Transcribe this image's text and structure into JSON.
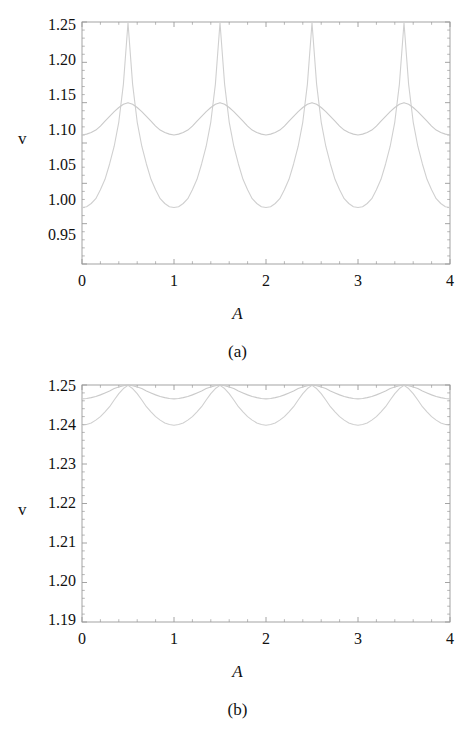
{
  "figure": {
    "background_color": "#ffffff",
    "text_color": "#111111",
    "frame_color": "#9a9a9a",
    "curve_color_primary": "#d2d2d2",
    "curve_color_secondary": "#c9c9c9"
  },
  "panels": [
    {
      "id": "a",
      "caption": "(a)",
      "xlabel": "A",
      "ylabel": "v",
      "x_ticks": [
        "0",
        "1",
        "2",
        "3",
        "4"
      ],
      "y_ticks": [
        "0.95",
        "1.00",
        "1.05",
        "1.10",
        "1.15",
        "1.20",
        "1.25"
      ]
    },
    {
      "id": "b",
      "caption": "(b)",
      "xlabel": "A",
      "ylabel": "v",
      "x_ticks": [
        "0",
        "1",
        "2",
        "3",
        "4"
      ],
      "y_ticks": [
        "1.19",
        "1.20",
        "1.21",
        "1.22",
        "1.23",
        "1.24",
        "1.25"
      ]
    }
  ],
  "chart_data": [
    {
      "type": "line",
      "panel": "a",
      "title": "(a)",
      "xlabel": "A",
      "ylabel": "v",
      "xlim": [
        0,
        4
      ],
      "ylim": [
        0.95,
        1.25
      ],
      "xticks": [
        0,
        1,
        2,
        3,
        4
      ],
      "yticks": [
        0.95,
        1.0,
        1.05,
        1.1,
        1.15,
        1.2,
        1.25
      ],
      "grid": false,
      "legend": "none",
      "frame": "box-with-inner-ticks",
      "series": [
        {
          "name": "large-amplitude oscillation",
          "color": "#d0d0d0",
          "description": "period 1 in A, minima 1.020 at A=0,1,2,3,4; maxima 1.249 at A=0.5,1.5,2.5,3.5",
          "x": [
            0.0,
            0.05,
            0.1,
            0.15,
            0.2,
            0.25,
            0.3,
            0.35,
            0.4,
            0.45,
            0.5,
            0.55,
            0.6,
            0.65,
            0.7,
            0.75,
            0.8,
            0.85,
            0.9,
            0.95,
            1.0,
            1.05,
            1.1,
            1.15,
            1.2,
            1.25,
            1.3,
            1.35,
            1.4,
            1.45,
            1.5,
            1.55,
            1.6,
            1.65,
            1.7,
            1.75,
            1.8,
            1.85,
            1.9,
            1.95,
            2.0,
            2.05,
            2.1,
            2.15,
            2.2,
            2.25,
            2.3,
            2.35,
            2.4,
            2.45,
            2.5,
            2.55,
            2.6,
            2.65,
            2.7,
            2.75,
            2.8,
            2.85,
            2.9,
            2.95,
            3.0,
            3.05,
            3.1,
            3.15,
            3.2,
            3.25,
            3.3,
            3.35,
            3.4,
            3.45,
            3.5,
            3.55,
            3.6,
            3.65,
            3.7,
            3.75,
            3.8,
            3.85,
            3.9,
            3.95,
            4.0
          ],
          "y": [
            1.02,
            1.021,
            1.025,
            1.031,
            1.042,
            1.055,
            1.074,
            1.096,
            1.126,
            1.173,
            1.249,
            1.173,
            1.126,
            1.096,
            1.074,
            1.055,
            1.042,
            1.031,
            1.025,
            1.021,
            1.02,
            1.021,
            1.025,
            1.031,
            1.042,
            1.055,
            1.074,
            1.096,
            1.126,
            1.173,
            1.249,
            1.173,
            1.126,
            1.096,
            1.074,
            1.055,
            1.042,
            1.031,
            1.025,
            1.021,
            1.02,
            1.021,
            1.025,
            1.031,
            1.042,
            1.055,
            1.074,
            1.096,
            1.126,
            1.173,
            1.249,
            1.173,
            1.126,
            1.096,
            1.074,
            1.055,
            1.042,
            1.031,
            1.025,
            1.021,
            1.02,
            1.021,
            1.025,
            1.031,
            1.042,
            1.055,
            1.074,
            1.096,
            1.126,
            1.173,
            1.249,
            1.173,
            1.126,
            1.096,
            1.074,
            1.055,
            1.042,
            1.031,
            1.025,
            1.021,
            1.02
          ]
        },
        {
          "name": "small-amplitude oscillation",
          "color": "#cacaca",
          "description": "period 1 in A, minima 1.110 at A=0,1,2,3,4; maxima 1.150 at A=0.5,1.5,2.5,3.5",
          "x": [
            0.0,
            0.05,
            0.1,
            0.15,
            0.2,
            0.25,
            0.3,
            0.35,
            0.4,
            0.45,
            0.5,
            0.55,
            0.6,
            0.65,
            0.7,
            0.75,
            0.8,
            0.85,
            0.9,
            0.95,
            1.0,
            1.05,
            1.1,
            1.15,
            1.2,
            1.25,
            1.3,
            1.35,
            1.4,
            1.45,
            1.5,
            1.55,
            1.6,
            1.65,
            1.7,
            1.75,
            1.8,
            1.85,
            1.9,
            1.95,
            2.0,
            2.05,
            2.1,
            2.15,
            2.2,
            2.25,
            2.3,
            2.35,
            2.4,
            2.45,
            2.5,
            2.55,
            2.6,
            2.65,
            2.7,
            2.75,
            2.8,
            2.85,
            2.9,
            2.95,
            3.0,
            3.05,
            3.1,
            3.15,
            3.2,
            3.25,
            3.3,
            3.35,
            3.4,
            3.45,
            3.5,
            3.55,
            3.6,
            3.65,
            3.7,
            3.75,
            3.8,
            3.85,
            3.9,
            3.95,
            4.0
          ],
          "y": [
            1.11,
            1.111,
            1.113,
            1.116,
            1.121,
            1.127,
            1.133,
            1.139,
            1.144,
            1.148,
            1.15,
            1.148,
            1.144,
            1.139,
            1.133,
            1.127,
            1.121,
            1.116,
            1.113,
            1.111,
            1.11,
            1.111,
            1.113,
            1.116,
            1.121,
            1.127,
            1.133,
            1.139,
            1.144,
            1.148,
            1.15,
            1.148,
            1.144,
            1.139,
            1.133,
            1.127,
            1.121,
            1.116,
            1.113,
            1.111,
            1.11,
            1.111,
            1.113,
            1.116,
            1.121,
            1.127,
            1.133,
            1.139,
            1.144,
            1.148,
            1.15,
            1.148,
            1.144,
            1.139,
            1.133,
            1.127,
            1.121,
            1.116,
            1.113,
            1.111,
            1.11,
            1.111,
            1.113,
            1.116,
            1.121,
            1.127,
            1.133,
            1.139,
            1.144,
            1.148,
            1.15,
            1.148,
            1.144,
            1.139,
            1.133,
            1.127,
            1.121,
            1.116,
            1.113,
            1.111,
            1.11
          ]
        }
      ]
    },
    {
      "type": "line",
      "panel": "b",
      "title": "(b)",
      "xlabel": "A",
      "ylabel": "v",
      "xlim": [
        0,
        4
      ],
      "ylim": [
        1.19,
        1.25
      ],
      "xticks": [
        0,
        1,
        2,
        3,
        4
      ],
      "yticks": [
        1.19,
        1.2,
        1.21,
        1.22,
        1.23,
        1.24,
        1.25
      ],
      "grid": false,
      "legend": "none",
      "frame": "box-with-inner-ticks",
      "series": [
        {
          "name": "larger-amplitude oscillation",
          "color": "#d0d0d0",
          "description": "period 1 in A, minima 1.2398 at A=0,1,2,3,4; maxima 1.2499 at A=0.5,1.5,2.5,3.5",
          "x": [
            0.0,
            0.05,
            0.1,
            0.15,
            0.2,
            0.25,
            0.3,
            0.35,
            0.4,
            0.45,
            0.5,
            0.55,
            0.6,
            0.65,
            0.7,
            0.75,
            0.8,
            0.85,
            0.9,
            0.95,
            1.0,
            1.05,
            1.1,
            1.15,
            1.2,
            1.25,
            1.3,
            1.35,
            1.4,
            1.45,
            1.5,
            1.55,
            1.6,
            1.65,
            1.7,
            1.75,
            1.8,
            1.85,
            1.9,
            1.95,
            2.0,
            2.05,
            2.1,
            2.15,
            2.2,
            2.25,
            2.3,
            2.35,
            2.4,
            2.45,
            2.5,
            2.55,
            2.6,
            2.65,
            2.7,
            2.75,
            2.8,
            2.85,
            2.9,
            2.95,
            3.0,
            3.05,
            3.1,
            3.15,
            3.2,
            3.25,
            3.3,
            3.35,
            3.4,
            3.45,
            3.5,
            3.55,
            3.6,
            3.65,
            3.7,
            3.75,
            3.8,
            3.85,
            3.9,
            3.95,
            4.0
          ],
          "y": [
            1.2398,
            1.24,
            1.2404,
            1.2411,
            1.242,
            1.2432,
            1.2445,
            1.2462,
            1.2478,
            1.2491,
            1.2499,
            1.2491,
            1.2478,
            1.2462,
            1.2445,
            1.2432,
            1.242,
            1.2411,
            1.2404,
            1.24,
            1.2398,
            1.24,
            1.2404,
            1.2411,
            1.242,
            1.2432,
            1.2445,
            1.2462,
            1.2478,
            1.2491,
            1.2499,
            1.2491,
            1.2478,
            1.2462,
            1.2445,
            1.2432,
            1.242,
            1.2411,
            1.2404,
            1.24,
            1.2398,
            1.24,
            1.2404,
            1.2411,
            1.242,
            1.2432,
            1.2445,
            1.2462,
            1.2478,
            1.2491,
            1.2499,
            1.2491,
            1.2478,
            1.2462,
            1.2445,
            1.2432,
            1.242,
            1.2411,
            1.2404,
            1.24,
            1.2398,
            1.24,
            1.2404,
            1.2411,
            1.242,
            1.2432,
            1.2445,
            1.2462,
            1.2478,
            1.2491,
            1.2499,
            1.2491,
            1.2478,
            1.2462,
            1.2445,
            1.2432,
            1.242,
            1.2411,
            1.2404,
            1.24,
            1.2398
          ]
        },
        {
          "name": "smaller-amplitude oscillation",
          "color": "#cacaca",
          "description": "period 1 in A, minima 1.2465 at A=0,1,2,3,4; maxima 1.2500 at A=0.5,1.5,2.5,3.5",
          "x": [
            0.0,
            0.05,
            0.1,
            0.15,
            0.2,
            0.25,
            0.3,
            0.35,
            0.4,
            0.45,
            0.5,
            0.55,
            0.6,
            0.65,
            0.7,
            0.75,
            0.8,
            0.85,
            0.9,
            0.95,
            1.0,
            1.05,
            1.1,
            1.15,
            1.2,
            1.25,
            1.3,
            1.35,
            1.4,
            1.45,
            1.5,
            1.55,
            1.6,
            1.65,
            1.7,
            1.75,
            1.8,
            1.85,
            1.9,
            1.95,
            2.0,
            2.05,
            2.1,
            2.15,
            2.2,
            2.25,
            2.3,
            2.35,
            2.4,
            2.45,
            2.5,
            2.55,
            2.6,
            2.65,
            2.7,
            2.75,
            2.8,
            2.85,
            2.9,
            2.95,
            3.0,
            3.05,
            3.1,
            3.15,
            3.2,
            3.25,
            3.3,
            3.35,
            3.4,
            3.45,
            3.5,
            3.55,
            3.6,
            3.65,
            3.7,
            3.75,
            3.8,
            3.85,
            3.9,
            3.95,
            4.0
          ],
          "y": [
            1.2465,
            1.2466,
            1.2468,
            1.2471,
            1.2475,
            1.248,
            1.2485,
            1.2491,
            1.2495,
            1.2498,
            1.25,
            1.2498,
            1.2495,
            1.2491,
            1.2485,
            1.248,
            1.2475,
            1.2471,
            1.2468,
            1.2466,
            1.2465,
            1.2466,
            1.2468,
            1.2471,
            1.2475,
            1.248,
            1.2485,
            1.2491,
            1.2495,
            1.2498,
            1.25,
            1.2498,
            1.2495,
            1.2491,
            1.2485,
            1.248,
            1.2475,
            1.2471,
            1.2468,
            1.2466,
            1.2465,
            1.2466,
            1.2468,
            1.2471,
            1.2475,
            1.248,
            1.2485,
            1.2491,
            1.2495,
            1.2498,
            1.25,
            1.2498,
            1.2495,
            1.2491,
            1.2485,
            1.248,
            1.2475,
            1.2471,
            1.2468,
            1.2466,
            1.2465,
            1.2466,
            1.2468,
            1.2471,
            1.2475,
            1.248,
            1.2485,
            1.2491,
            1.2495,
            1.2498,
            1.25,
            1.2498,
            1.2495,
            1.2491,
            1.2485,
            1.248,
            1.2475,
            1.2471,
            1.2468,
            1.2466,
            1.2465
          ]
        }
      ]
    }
  ]
}
